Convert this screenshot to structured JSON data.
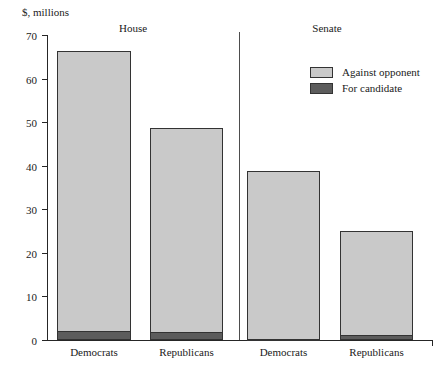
{
  "chart_data": {
    "type": "bar",
    "title": "",
    "subtitle": "",
    "xlabel": "",
    "ylabel": "$, millions",
    "ylim": [
      0,
      70
    ],
    "yticks": [
      0,
      10,
      20,
      30,
      40,
      50,
      60,
      70
    ],
    "ytick_labels": [
      "0",
      "10",
      "20",
      "30",
      "40",
      "50",
      "60",
      "70"
    ],
    "grid": false,
    "stacked": true,
    "legend_position": "upper-right-inside",
    "groups": [
      {
        "name": "House",
        "label": "House"
      },
      {
        "name": "Senate",
        "label": "Senate"
      }
    ],
    "categories": [
      "Democrats",
      "Republicans",
      "Democrats",
      "Republicans"
    ],
    "series": [
      {
        "name": "For candidate",
        "label": "For candidate",
        "color": "#5c5c5c",
        "values": [
          2.1,
          1.9,
          0.2,
          1.2
        ]
      },
      {
        "name": "Against opponent",
        "label": "Against opponent",
        "color": "#c9c9c9",
        "values": [
          64.2,
          46.7,
          38.6,
          23.9
        ]
      }
    ],
    "bar_totals": [
      66.3,
      48.6,
      38.8,
      25.1
    ],
    "annotations": []
  },
  "colors": {
    "against_opponent": "#c9c9c9",
    "for_candidate": "#5c5c5c",
    "axis": "#262626",
    "bar_outline": "#333333",
    "divider": "#4d4d4d",
    "background": "#ffffff"
  }
}
